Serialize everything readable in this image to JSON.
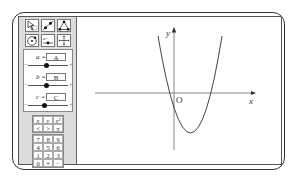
{
  "toolbar": {
    "tools": [
      {
        "icon": "select-cursor-icon"
      },
      {
        "icon": "line-through-points-icon"
      },
      {
        "icon": "polygon-icon"
      },
      {
        "icon": "circle-icon"
      },
      {
        "icon": "slider-tool-icon"
      },
      {
        "icon": "move-view-icon"
      }
    ]
  },
  "sliders": [
    {
      "label": "a =",
      "value": "A",
      "minus": "−",
      "plus": "+",
      "knob_pos": 0.45
    },
    {
      "label": "b =",
      "value": "B",
      "minus": "−",
      "plus": "+",
      "knob_pos": 0.45
    },
    {
      "label": "c =",
      "value": "C",
      "minus": "−",
      "plus": "+",
      "knob_pos": 0.4
    }
  ],
  "keypad": {
    "symbols": [
      "x",
      "y",
      "x²",
      "<",
      ">",
      "π"
    ],
    "digits": [
      "7",
      "8",
      "9",
      "4",
      "5",
      "6",
      "1",
      "2",
      "3",
      "0",
      "+",
      "−"
    ]
  },
  "graph": {
    "x_label": "x",
    "y_label": "y",
    "origin_label": "O",
    "curve": "parabola opening upward, vertex in fourth quadrant"
  }
}
